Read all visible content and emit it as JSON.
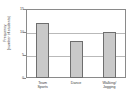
{
  "chart_data": {
    "type": "bar",
    "title": "",
    "xlabel": "",
    "ylabel": "Frequency (number of students)",
    "ylabel_line1": "Frequency",
    "ylabel_line2": "(number of students)",
    "categories": [
      "Team Sports",
      "Dance",
      "Walking/Jogging"
    ],
    "category_lines": [
      [
        "Team",
        "Sports"
      ],
      [
        "Dance",
        ""
      ],
      [
        "Walking/",
        "Jogging"
      ]
    ],
    "values": [
      12,
      8,
      10
    ],
    "ylim": [
      0,
      15
    ],
    "yticks": [
      0,
      5,
      10,
      15
    ],
    "ytick_labels": [
      "0",
      "5",
      "10",
      "15"
    ],
    "grid": true,
    "grid_axis": "y",
    "legend": "none",
    "bar_fill_color": "#c9c9c9",
    "bar_edge_color": "#6e6e6e",
    "gridline_color": "#b9b9b9",
    "axis_color": "#8a8a8a",
    "text_color": "#3a3a3a",
    "background_color": "#ffffff"
  }
}
